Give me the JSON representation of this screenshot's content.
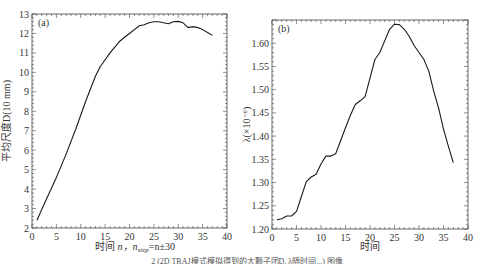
{
  "chart_data": [
    {
      "type": "line",
      "panel": "(a)",
      "title": "",
      "xlabel": "时间  n，n_step=n±30",
      "ylabel": "平均尺度D(10 mm)",
      "xlim": [
        0,
        40
      ],
      "ylim": [
        2,
        13
      ],
      "xticks": [
        0,
        5,
        10,
        15,
        20,
        25,
        30,
        35,
        40
      ],
      "yticks": [
        2,
        3,
        4,
        5,
        6,
        7,
        8,
        9,
        10,
        11,
        12,
        13
      ],
      "grid": false,
      "x": [
        1,
        3,
        5,
        7,
        9,
        11,
        13,
        14,
        16,
        18,
        19,
        20,
        21,
        22,
        23,
        24,
        25,
        26,
        27,
        28,
        29,
        30,
        31,
        32,
        33,
        34,
        35,
        36,
        37
      ],
      "series": [
        {
          "name": "D",
          "values": [
            2.4,
            3.5,
            4.6,
            5.8,
            7.1,
            8.5,
            9.8,
            10.3,
            11.0,
            11.6,
            11.8,
            12.0,
            12.2,
            12.4,
            12.45,
            12.55,
            12.6,
            12.6,
            12.55,
            12.5,
            12.6,
            12.62,
            12.55,
            12.3,
            12.35,
            12.3,
            12.2,
            12.05,
            11.9
          ]
        }
      ]
    },
    {
      "type": "line",
      "panel": "(b)",
      "title": "",
      "xlabel": "时间",
      "ylabel": "λ(×10⁻⁶)",
      "xlim": [
        0,
        40
      ],
      "ylim": [
        1.2,
        1.65
      ],
      "xticks": [
        0,
        5,
        10,
        15,
        20,
        25,
        30,
        35,
        40
      ],
      "yticks": [
        1.2,
        1.25,
        1.3,
        1.35,
        1.4,
        1.45,
        1.5,
        1.55,
        1.6
      ],
      "grid": false,
      "x": [
        1,
        2,
        3,
        4,
        5,
        6,
        7,
        8,
        9,
        10,
        11,
        12,
        13,
        14,
        15,
        16,
        17,
        18,
        19,
        20,
        21,
        22,
        23,
        24,
        25,
        26,
        27,
        28,
        29,
        30,
        31,
        32,
        33,
        34,
        35,
        36,
        37
      ],
      "series": [
        {
          "name": "lambda",
          "values": [
            1.22,
            1.222,
            1.228,
            1.228,
            1.238,
            1.27,
            1.302,
            1.312,
            1.318,
            1.34,
            1.357,
            1.357,
            1.362,
            1.39,
            1.418,
            1.445,
            1.468,
            1.476,
            1.485,
            1.525,
            1.565,
            1.58,
            1.605,
            1.63,
            1.641,
            1.64,
            1.63,
            1.615,
            1.595,
            1.58,
            1.565,
            1.54,
            1.497,
            1.46,
            1.415,
            1.378,
            1.343
          ]
        }
      ]
    }
  ],
  "figure": {
    "panel_a": {
      "tag": "(a)",
      "ylabel": "平均尺度D(10 mm)",
      "xlabel_time": "时间",
      "xlabel_n": "n，n",
      "xlabel_sub": "step",
      "xlabel_tail": "=n±30",
      "xtick_labels": [
        "0",
        "5",
        "10",
        "15",
        "20",
        "25",
        "30",
        "35",
        "40"
      ],
      "ytick_labels": [
        "2",
        "3",
        "4",
        "5",
        "6",
        "7",
        "8",
        "9",
        "10",
        "11",
        "12",
        "13"
      ]
    },
    "panel_b": {
      "tag": "(b)",
      "ylabel": "λ(×10⁻⁶)",
      "xlabel": "时间",
      "xtick_labels": [
        "0",
        "5",
        "10",
        "15",
        "20",
        "25",
        "30",
        "35",
        "40"
      ],
      "ytick_labels": [
        "1.20",
        "1.25",
        "1.30",
        "1.35",
        "1.40",
        "1.45",
        "1.50",
        "1.55",
        "1.60"
      ]
    },
    "caption": "2 (2D TRAJ模式模拟得到的大颗子团D, λ随时间...) 图像"
  },
  "colors": {
    "line": "#1a1a1a",
    "axis": "#444444",
    "text": "#333333"
  }
}
